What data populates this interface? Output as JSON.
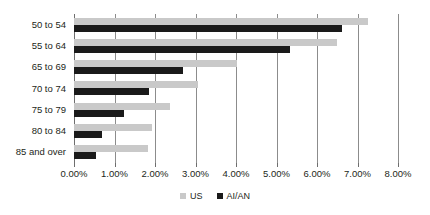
{
  "chart_data": {
    "type": "bar",
    "orientation": "horizontal",
    "title": "",
    "subtitle": "",
    "xlabel": "",
    "ylabel": "",
    "categories": [
      "50 to 54",
      "55 to 64",
      "65 to 69",
      "70 to 74",
      "75 to 79",
      "80 to 84",
      "85 and over"
    ],
    "series": [
      {
        "name": "US",
        "color": "#c9c9c9",
        "values": [
          7.26,
          6.49,
          4.03,
          3.06,
          2.37,
          1.93,
          1.83
        ]
      },
      {
        "name": "AI/AN",
        "color": "#1a1a1a",
        "values": [
          6.62,
          5.33,
          2.69,
          1.85,
          1.23,
          0.7,
          0.54
        ]
      }
    ],
    "xlim": [
      0,
      8
    ],
    "xtick_values": [
      0,
      1,
      2,
      3,
      4,
      5,
      6,
      7,
      8
    ],
    "xtick_labels": [
      "0.00%",
      "1.00%",
      "2.00%",
      "3.00%",
      "4.00%",
      "5.00%",
      "6.00%",
      "7.00%",
      "8.00%"
    ],
    "grid": true,
    "grid_axis": "x",
    "legend_position": "bottom-center",
    "legend_entries": [
      "US",
      "AI/AN"
    ]
  },
  "legend": {
    "items": [
      {
        "label": "US"
      },
      {
        "label": "AI/AN"
      }
    ]
  }
}
